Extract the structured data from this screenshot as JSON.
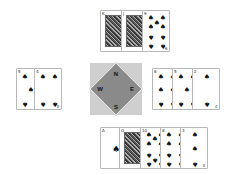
{
  "compass": {
    "north": "N",
    "east": "E",
    "south": "S",
    "west": "W",
    "colors": {
      "background": "#cfcfcf",
      "diamond": "#8a8a8a",
      "border": "#f2f2f2"
    }
  },
  "hands": {
    "north": {
      "cards": [
        {
          "rank": "K",
          "suit": "♠"
        },
        {
          "rank": "J",
          "suit": "♠"
        },
        {
          "rank": "9",
          "suit": "♠"
        }
      ]
    },
    "west": {
      "cards": [
        {
          "rank": "5",
          "suit": "♠"
        },
        {
          "rank": "4",
          "suit": "♠"
        }
      ]
    },
    "east": {
      "cards": [
        {
          "rank": "6",
          "suit": "♠"
        },
        {
          "rank": "5",
          "suit": "♠"
        },
        {
          "rank": "2",
          "suit": "♠"
        }
      ]
    },
    "south": {
      "cards": [
        {
          "rank": "A",
          "suit": "♠"
        },
        {
          "rank": "Q",
          "suit": "♠"
        },
        {
          "rank": "10",
          "suit": "♠"
        },
        {
          "rank": "8",
          "suit": "♠"
        },
        {
          "rank": "3",
          "suit": "♠"
        }
      ]
    }
  }
}
